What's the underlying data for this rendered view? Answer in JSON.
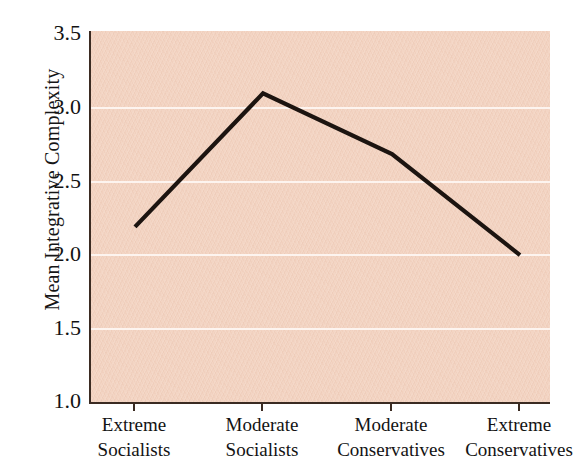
{
  "chart_data": {
    "type": "line",
    "title": "",
    "subtitle": "",
    "xlabel": "",
    "ylabel": "Mean Integrative Complexity",
    "categories": [
      "Extreme Socialists",
      "Moderate Socialists",
      "Moderate Conservatives",
      "Extreme Conservatives"
    ],
    "category_lines": [
      {
        "line1": "Extreme",
        "line2": "Socialists"
      },
      {
        "line1": "Moderate",
        "line2": "Socialists"
      },
      {
        "line1": "Moderate",
        "line2": "Conservatives"
      },
      {
        "line1": "Extreme",
        "line2": "Conservatives"
      }
    ],
    "values": [
      2.18,
      3.08,
      2.67,
      1.99
    ],
    "series": [
      {
        "name": "Mean Integrative Complexity",
        "values": [
          2.18,
          3.08,
          2.67,
          1.99
        ]
      }
    ],
    "ylim": [
      1.0,
      3.5
    ],
    "yticks": [
      3.5,
      3.0,
      2.5,
      2.0,
      1.5,
      1.0
    ],
    "ytick_labels": [
      "3.5",
      "3.0",
      "2.5",
      "2.0",
      "1.5",
      "1.0"
    ],
    "grid": true,
    "grid_axis": "y",
    "legend": false,
    "legend_position": "none",
    "annotations": []
  },
  "style": {
    "plot_background": "#f3d3c1",
    "page_background": "#ffffff",
    "gridline_color": "#fdf4ef",
    "line_color": "#1c1410",
    "axis_color": "#3b2b22",
    "text_color": "#131313"
  }
}
